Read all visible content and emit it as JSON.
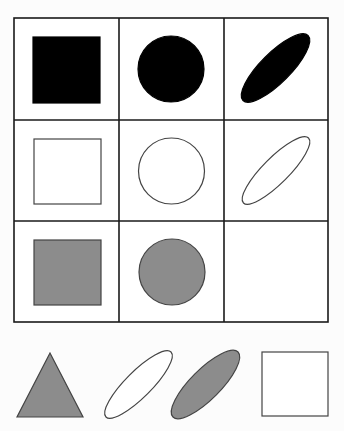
{
  "puzzle": {
    "type": "matrix-reasoning",
    "grid": {
      "rows": 3,
      "cols": 3,
      "x": 14,
      "y": 18,
      "width": 314,
      "height": 304,
      "col_lines": [
        119,
        224
      ],
      "row_lines": [
        120,
        221
      ],
      "line_color": "#1a1a1a",
      "line_width": 1.6
    },
    "colors": {
      "black": "#000000",
      "white": "#ffffff",
      "gray": "#8c8c8c",
      "stroke": "#444444"
    },
    "cells": [
      {
        "row": 0,
        "col": 0,
        "shape": "square",
        "fill": "black",
        "x": 33,
        "y": 37,
        "w": 67,
        "h": 66
      },
      {
        "row": 0,
        "col": 1,
        "shape": "circle",
        "fill": "black",
        "cx": 171,
        "cy": 69,
        "r": 33
      },
      {
        "row": 0,
        "col": 2,
        "shape": "ellipse",
        "fill": "black",
        "cx": 275.5,
        "cy": 68,
        "rx": 46,
        "ry": 15,
        "rotate": -45
      },
      {
        "row": 1,
        "col": 0,
        "shape": "square",
        "fill": "white",
        "x": 34,
        "y": 139,
        "w": 67,
        "h": 65
      },
      {
        "row": 1,
        "col": 1,
        "shape": "circle",
        "fill": "white",
        "cx": 171.5,
        "cy": 171,
        "r": 33
      },
      {
        "row": 1,
        "col": 2,
        "shape": "ellipse",
        "fill": "white",
        "cx": 276,
        "cy": 170.5,
        "rx": 46,
        "ry": 13,
        "rotate": -45
      },
      {
        "row": 2,
        "col": 0,
        "shape": "square",
        "fill": "gray",
        "x": 34,
        "y": 240,
        "w": 67,
        "h": 65
      },
      {
        "row": 2,
        "col": 1,
        "shape": "circle",
        "fill": "gray",
        "cx": 172,
        "cy": 272,
        "r": 33
      },
      {
        "row": 2,
        "col": 2,
        "shape": "empty"
      }
    ],
    "options": [
      {
        "index": 1,
        "shape": "triangle",
        "fill": "gray",
        "points": "50,353 17,417 83,417"
      },
      {
        "index": 2,
        "shape": "ellipse",
        "fill": "white",
        "cx": 138.5,
        "cy": 384.5,
        "rx": 46,
        "ry": 13,
        "rotate": -45
      },
      {
        "index": 3,
        "shape": "ellipse",
        "fill": "gray",
        "cx": 205.5,
        "cy": 384.5,
        "rx": 46,
        "ry": 15,
        "rotate": -45
      },
      {
        "index": 4,
        "shape": "square",
        "fill": "white",
        "x": 262,
        "y": 352,
        "w": 66,
        "h": 64
      }
    ]
  }
}
